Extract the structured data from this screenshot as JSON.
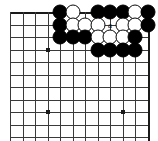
{
  "diagram": {
    "board": {
      "columns": 12,
      "rows": 11,
      "origin_x": 10,
      "origin_y": 12,
      "spacing": 12.5,
      "line_color": "#3a3a3a",
      "edge_color": "#1a1a1a",
      "background": "#ffffff",
      "star_points": [
        {
          "col": 3,
          "row": 3
        },
        {
          "col": 3,
          "row": 8
        },
        {
          "col": 9,
          "row": 8
        }
      ]
    },
    "stones": [
      {
        "col": 4,
        "row": 0,
        "color": "black"
      },
      {
        "col": 5,
        "row": 0,
        "color": "white"
      },
      {
        "col": 7,
        "row": 0,
        "color": "black"
      },
      {
        "col": 8,
        "row": 0,
        "color": "black"
      },
      {
        "col": 9,
        "row": 0,
        "color": "black"
      },
      {
        "col": 10,
        "row": 0,
        "color": "white"
      },
      {
        "col": 11,
        "row": 0,
        "color": "black"
      },
      {
        "col": 4,
        "row": 1,
        "color": "black"
      },
      {
        "col": 5,
        "row": 1,
        "color": "white"
      },
      {
        "col": 6,
        "row": 1,
        "color": "white"
      },
      {
        "col": 7,
        "row": 1,
        "color": "white"
      },
      {
        "col": 9,
        "row": 1,
        "color": "white"
      },
      {
        "col": 10,
        "row": 1,
        "color": "white"
      },
      {
        "col": 11,
        "row": 1,
        "color": "black"
      },
      {
        "col": 4,
        "row": 2,
        "color": "black"
      },
      {
        "col": 5,
        "row": 2,
        "color": "black"
      },
      {
        "col": 6,
        "row": 2,
        "color": "black"
      },
      {
        "col": 7,
        "row": 2,
        "color": "white"
      },
      {
        "col": 8,
        "row": 2,
        "color": "white"
      },
      {
        "col": 9,
        "row": 2,
        "color": "white"
      },
      {
        "col": 10,
        "row": 2,
        "color": "black"
      },
      {
        "col": 7,
        "row": 3,
        "color": "black"
      },
      {
        "col": 8,
        "row": 3,
        "color": "black"
      },
      {
        "col": 9,
        "row": 3,
        "color": "black"
      },
      {
        "col": 10,
        "row": 3,
        "color": "black"
      }
    ],
    "markers": [
      {
        "col": 8,
        "row": 1,
        "label": "a"
      }
    ]
  }
}
